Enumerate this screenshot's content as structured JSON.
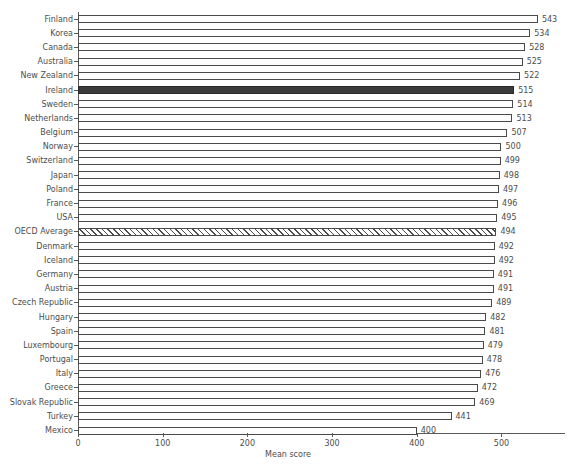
{
  "chart_data": {
    "type": "bar",
    "orientation": "horizontal",
    "title": "",
    "xlabel": "Mean score",
    "ylabel": "",
    "xlim": [
      0,
      575
    ],
    "xticks": [
      0,
      100,
      200,
      300,
      400,
      500
    ],
    "xtick_labels": [
      "0",
      "100",
      "200",
      "300",
      "400",
      "500"
    ],
    "grid": false,
    "legend": null,
    "value_labels": true,
    "categories": [
      "Finland",
      "Korea",
      "Canada",
      "Australia",
      "New Zealand",
      "Ireland",
      "Sweden",
      "Netherlands",
      "Belgium",
      "Norway",
      "Switzerland",
      "Japan",
      "Poland",
      "France",
      "USA",
      "OECD Average",
      "Denmark",
      "Iceland",
      "Germany",
      "Austria",
      "Czech Republic",
      "Hungary",
      "Spain",
      "Luxembourg",
      "Portugal",
      "Italy",
      "Greece",
      "Slovak Republic",
      "Turkey",
      "Mexico"
    ],
    "values": [
      543,
      534,
      528,
      525,
      522,
      515,
      514,
      513,
      507,
      500,
      499,
      498,
      497,
      496,
      495,
      494,
      492,
      492,
      491,
      491,
      489,
      482,
      481,
      479,
      478,
      476,
      472,
      469,
      441,
      400
    ],
    "bar_styles": [
      "plain",
      "plain",
      "plain",
      "plain",
      "plain",
      "highlight",
      "plain",
      "plain",
      "plain",
      "plain",
      "plain",
      "plain",
      "plain",
      "plain",
      "plain",
      "hatched",
      "plain",
      "plain",
      "plain",
      "plain",
      "plain",
      "plain",
      "plain",
      "plain",
      "plain",
      "plain",
      "plain",
      "plain",
      "plain",
      "plain"
    ],
    "colors": {
      "bar_fill": "#fdfdfd",
      "bar_edge": "#4a4a4a",
      "highlight_fill": "#3a3a3a",
      "hatch_color": "#4a4a4a",
      "axis": "#595959",
      "text": "#4d4d4d",
      "background": "#ffffff"
    }
  }
}
